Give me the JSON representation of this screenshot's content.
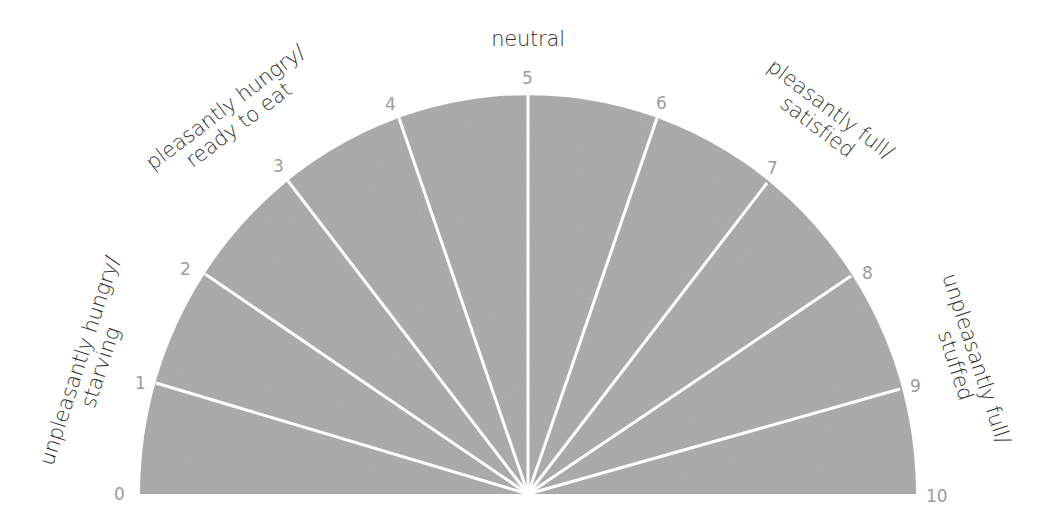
{
  "diagram": {
    "type": "hunger-fullness-scale",
    "colors": {
      "fill": "#a9a9a9",
      "divider": "#ffffff",
      "tick_number": "#9b9b9b",
      "label_text": "#2f2f2f",
      "background": "#ffffff"
    },
    "ticks": [
      {
        "value": "0"
      },
      {
        "value": "1"
      },
      {
        "value": "2"
      },
      {
        "value": "3"
      },
      {
        "value": "4"
      },
      {
        "value": "5"
      },
      {
        "value": "6"
      },
      {
        "value": "7"
      },
      {
        "value": "8"
      },
      {
        "value": "9"
      },
      {
        "value": "10"
      }
    ],
    "zones": {
      "unpleasantly_hungry": {
        "line1": "unpleasantly hungry/",
        "line2": "starving"
      },
      "pleasantly_hungry": {
        "line1": "pleasantly hungry/",
        "line2": "ready to eat"
      },
      "neutral": {
        "line1": "neutral"
      },
      "pleasantly_full": {
        "line1": "pleasantly full/",
        "line2": "satisfied"
      },
      "unpleasantly_full": {
        "line1": "unpleasantly full/",
        "line2": "stuffed"
      }
    }
  }
}
